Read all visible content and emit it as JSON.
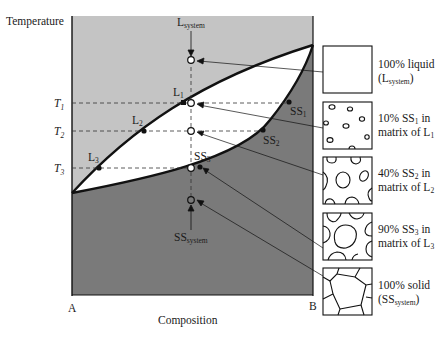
{
  "diagram": {
    "type": "binary isomorphous phase diagram with microstructure sequence",
    "axes": {
      "y_label": "Temperature",
      "x_label": "Composition",
      "x_left_label": "A",
      "x_right_label": "B",
      "temperature_marks": [
        {
          "main": "T",
          "sub": "1"
        },
        {
          "main": "T",
          "sub": "2"
        },
        {
          "main": "T",
          "sub": "3"
        }
      ]
    },
    "colors": {
      "liquid_region": "#c4c4c4",
      "two_phase_region": "#ffffff",
      "solid_region": "#7a7a7a",
      "lines": "#111111"
    },
    "system_labels": {
      "liquid": {
        "main": "L",
        "sub": "system"
      },
      "solid": {
        "main": "SS",
        "sub": "system"
      }
    },
    "liquidus_points": [
      {
        "main": "L",
        "sub": "1"
      },
      {
        "main": "L",
        "sub": "2"
      },
      {
        "main": "L",
        "sub": "3"
      }
    ],
    "solidus_points": [
      {
        "main": "SS",
        "sub": "1"
      },
      {
        "main": "SS",
        "sub": "2"
      },
      {
        "main": "SS",
        "sub": "3"
      }
    ],
    "microstructures": [
      {
        "line1": "100% liquid",
        "line2_main": "(L",
        "line2_sub": "system",
        "line2_end": ")"
      },
      {
        "line1_main": "10% SS",
        "line1_sub": "1",
        "line1_end": " in",
        "line2_main": "matrix of L",
        "line2_sub": "1"
      },
      {
        "line1_main": "40% SS",
        "line1_sub": "2",
        "line1_end": " in",
        "line2_main": "matrix of L",
        "line2_sub": "2"
      },
      {
        "line1_main": "90% SS",
        "line1_sub": "3",
        "line1_end": " in",
        "line2_main": "matrix of L",
        "line2_sub": "3"
      },
      {
        "line1": "100% solid",
        "line2_main": "(SS",
        "line2_sub": "system",
        "line2_end": ")"
      }
    ]
  }
}
